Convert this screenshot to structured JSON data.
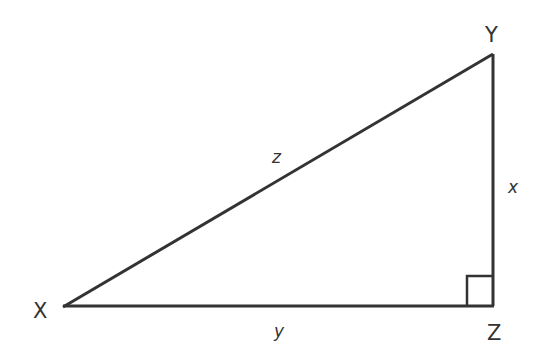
{
  "diagram": {
    "type": "right-triangle",
    "stroke_color": "#333333",
    "background": "#ffffff",
    "vertices": {
      "X": {
        "label": "X",
        "x": 63,
        "y": 307
      },
      "Y": {
        "label": "Y",
        "x": 493,
        "y": 54
      },
      "Z": {
        "label": "Z",
        "x": 493,
        "y": 306
      }
    },
    "sides": {
      "hypotenuse": {
        "label": "z",
        "from": "X",
        "to": "Y"
      },
      "vertical": {
        "label": "x",
        "from": "Y",
        "to": "Z"
      },
      "base": {
        "label": "y",
        "from": "X",
        "to": "Z"
      }
    },
    "right_angle_at": "Z"
  }
}
